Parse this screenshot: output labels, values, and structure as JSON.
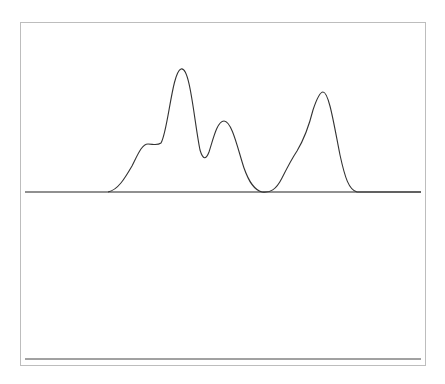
{
  "chart_data": [
    {
      "type": "line",
      "title": "",
      "xlabel": "",
      "ylabel": "",
      "grid": false,
      "axis_ticks": 26,
      "xlim": [
        0,
        25
      ],
      "ylim": [
        0,
        1
      ],
      "description": "Smooth envelope spectrum with two peak groups",
      "peaks": [
        {
          "x": 7.7,
          "y": 0.39,
          "kind": "shoulder"
        },
        {
          "x": 9.8,
          "y": 1.0
        },
        {
          "x": 11.2,
          "y": 0.27,
          "kind": "valley"
        },
        {
          "x": 12.4,
          "y": 0.59
        },
        {
          "x": 14.9,
          "y": 0.0,
          "kind": "valley"
        },
        {
          "x": 17.0,
          "y": 0.34,
          "kind": "shoulder"
        },
        {
          "x": 18.7,
          "y": 0.81
        }
      ]
    },
    {
      "type": "bar",
      "style": "stick",
      "title": "",
      "xlabel": "",
      "ylabel": "",
      "grid": false,
      "x": [
        5.5,
        6.5,
        7.5,
        8.5,
        9.5,
        10.5,
        11.5,
        12.5,
        13.5,
        14.5,
        15.5,
        16.5,
        17.5,
        18.5,
        19.5,
        20.5
      ],
      "values": [
        0.02,
        0.14,
        0.41,
        0.49,
        1.0,
        0.86,
        0.39,
        0.67,
        0.34,
        0.04,
        0.02,
        0.2,
        0.46,
        0.87,
        0.62,
        0.07
      ],
      "ylim": [
        0,
        1
      ]
    }
  ],
  "colors": {
    "frame": "#bdbdbd",
    "line": "#333333",
    "axis": "#222222",
    "sticks": "#666666",
    "background": "#ffffff"
  }
}
